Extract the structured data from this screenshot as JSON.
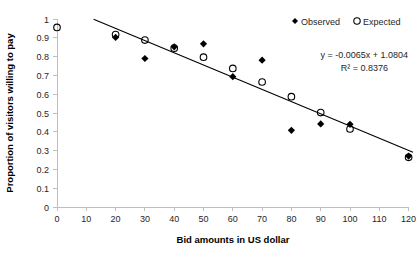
{
  "chart_data": {
    "type": "scatter",
    "title": "",
    "xlabel": "Bid amounts in US dollar",
    "ylabel": "Proportion of visitors willing to pay",
    "xlim": [
      0,
      120
    ],
    "ylim": [
      0,
      1
    ],
    "xticks": [
      0,
      10,
      20,
      30,
      40,
      50,
      60,
      70,
      80,
      90,
      100,
      110,
      120
    ],
    "xtick_labels": [
      "0",
      "10",
      "20",
      "30",
      "40",
      "50",
      "60",
      "70",
      "80",
      "90",
      "100",
      "110",
      "120"
    ],
    "yticks": [
      0,
      0.1,
      0.2,
      0.3,
      0.4,
      0.5,
      0.6,
      0.7,
      0.8,
      0.9,
      1
    ],
    "ytick_labels": [
      "0",
      "0.1",
      "0.2",
      "0.3",
      "0.4",
      "0.5",
      "0.6",
      "0.7",
      "0.8",
      "0.9",
      "1"
    ],
    "grid": false,
    "legend_position": "top-right",
    "series": [
      {
        "name": "Observed",
        "marker": "filled-diamond",
        "color": "#000000",
        "points": [
          {
            "x": 20,
            "y": 0.902
          },
          {
            "x": 30,
            "y": 0.79
          },
          {
            "x": 40,
            "y": 0.852
          },
          {
            "x": 50,
            "y": 0.868
          },
          {
            "x": 60,
            "y": 0.693
          },
          {
            "x": 70,
            "y": 0.781
          },
          {
            "x": 80,
            "y": 0.408
          },
          {
            "x": 90,
            "y": 0.442
          },
          {
            "x": 100,
            "y": 0.44
          },
          {
            "x": 120,
            "y": 0.271
          }
        ]
      },
      {
        "name": "Expected",
        "marker": "open-circle",
        "color": "#000000",
        "points": [
          {
            "x": 0,
            "y": 0.955
          },
          {
            "x": 20,
            "y": 0.917
          },
          {
            "x": 30,
            "y": 0.888
          },
          {
            "x": 40,
            "y": 0.845
          },
          {
            "x": 50,
            "y": 0.797
          },
          {
            "x": 60,
            "y": 0.737
          },
          {
            "x": 70,
            "y": 0.665
          },
          {
            "x": 80,
            "y": 0.587
          },
          {
            "x": 90,
            "y": 0.502
          },
          {
            "x": 100,
            "y": 0.415
          },
          {
            "x": 120,
            "y": 0.264
          }
        ]
      }
    ],
    "trendline": {
      "slope": -0.0065,
      "intercept": 1.0804,
      "x_start": 12.5,
      "x_end": 121.5,
      "equation": "y = -0.0065x + 1.0804",
      "r_squared_label": "R² = 0.8376",
      "r_squared_value": 0.8376
    },
    "annotations": [
      "y = -0.0065x + 1.0804",
      "R² = 0.8376"
    ]
  },
  "legend": {
    "observed_label": "Observed",
    "expected_label": "Expected",
    "observed_marker": "filled-diamond-marker",
    "expected_marker": "open-circle-marker"
  },
  "equation_block": {
    "line1": "y = -0.0065x + 1.0804",
    "line2": "R² = 0.8376"
  },
  "axes": {
    "x_title": "Bid amounts in US dollar",
    "y_title": "Proportion of visitors willing to pay"
  },
  "colors": {
    "marker": "#000000",
    "trendline": "#000000",
    "axis": "#bfbfbf",
    "text": "#262626",
    "background": "#ffffff"
  }
}
